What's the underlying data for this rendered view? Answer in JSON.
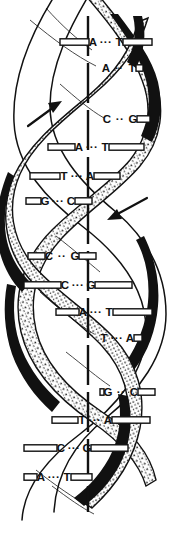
{
  "figure": {
    "background_color": "#ffffff",
    "ink_color": "#111111",
    "width": 171,
    "height": 538
  },
  "axis": {
    "name": "central-axis",
    "style": "dashed-vertical",
    "x": 88,
    "y_top": 16,
    "y_bottom": 512
  },
  "strands": [
    {
      "name": "stippled-strand",
      "fill": "stippled",
      "direction_label": "up"
    },
    {
      "name": "shaded-strand",
      "fill": "outlined-dark-edge",
      "direction_label": "down"
    }
  ],
  "arrows": [
    {
      "name": "left-arrow",
      "direction": "up-right",
      "x1": 28,
      "y1": 126,
      "x2": 62,
      "y2": 101
    },
    {
      "name": "right-arrow",
      "direction": "down-left",
      "x1": 147,
      "y1": 198,
      "x2": 107,
      "y2": 220
    }
  ],
  "base_pairs": [
    {
      "index": 1,
      "left": "A",
      "bond": "···",
      "right": "T",
      "y": 42,
      "cx": 106,
      "rung_left": 60,
      "rung_right": 152
    },
    {
      "index": 2,
      "left": "A",
      "bond": "··",
      "right": "T",
      "y": 68,
      "cx": 119,
      "rung_left": 100,
      "rung_right": 143
    },
    {
      "index": 3,
      "left": "C",
      "bond": "··",
      "right": "G",
      "y": 119,
      "cx": 120,
      "rung_left": 101,
      "rung_right": 150
    },
    {
      "index": 4,
      "left": "A",
      "bond": "···",
      "right": "T",
      "y": 147,
      "cx": 92,
      "rung_left": 48,
      "rung_right": 144
    },
    {
      "index": 5,
      "left": "T",
      "bond": "···",
      "right": "A",
      "y": 176,
      "cx": 77,
      "rung_left": 30,
      "rung_right": 120
    },
    {
      "index": 6,
      "left": "G",
      "bond": "···",
      "right": "C",
      "y": 201,
      "cx": 58,
      "rung_left": 26,
      "rung_right": 92
    },
    {
      "index": 7,
      "left": "C",
      "bond": "··",
      "right": "G",
      "y": 256,
      "cx": 62,
      "rung_left": 28,
      "rung_right": 96
    },
    {
      "index": 8,
      "left": "C",
      "bond": "···",
      "right": "G",
      "y": 285,
      "cx": 78,
      "rung_left": 24,
      "rung_right": 132
    },
    {
      "index": 9,
      "left": "A",
      "bond": "···",
      "right": "T",
      "y": 312,
      "cx": 96,
      "rung_left": 56,
      "rung_right": 152
    },
    {
      "index": 10,
      "left": "T",
      "bond": "···",
      "right": "A",
      "y": 338,
      "cx": 117,
      "rung_left": 98,
      "rung_right": 142
    },
    {
      "index": 11,
      "left": "G",
      "bond": "··",
      "right": "C",
      "y": 392,
      "cx": 121,
      "rung_left": 100,
      "rung_right": 155
    },
    {
      "index": 12,
      "left": "T",
      "bond": "···",
      "right": "A",
      "y": 420,
      "cx": 95,
      "rung_left": 52,
      "rung_right": 150
    },
    {
      "index": 13,
      "left": "C",
      "bond": "···",
      "right": "G",
      "y": 448,
      "cx": 74,
      "rung_left": 24,
      "rung_right": 128
    },
    {
      "index": 14,
      "left": "A",
      "bond": "···",
      "right": "T",
      "y": 477,
      "cx": 54,
      "rung_left": 24,
      "rung_right": 92
    }
  ]
}
